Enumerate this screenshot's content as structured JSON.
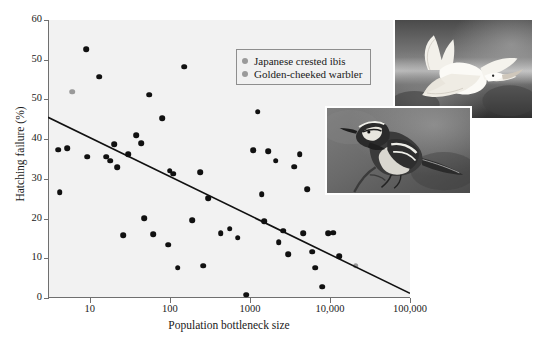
{
  "chart_data": {
    "type": "scatter",
    "title": "",
    "xlabel": "Population bottleneck size",
    "ylabel": "Hatching failure (%)",
    "xscale": "log",
    "xlim": [
      3,
      100000
    ],
    "ylim": [
      0,
      60
    ],
    "xticks": [
      10,
      100,
      1000,
      10000,
      100000
    ],
    "xtick_labels": [
      "10",
      "100",
      "1000",
      "10,000",
      "100,000"
    ],
    "yticks": [
      0,
      10,
      20,
      30,
      40,
      50,
      50,
      60
    ],
    "ytick_labels": [
      "0",
      "10",
      "20",
      "30",
      "40",
      "50",
      "50",
      "60"
    ],
    "grid": false,
    "legend_position": "upper-right-inside",
    "series": [
      {
        "name": "All species",
        "color": "#111111",
        "points": [
          [
            4.0,
            32.0
          ],
          [
            4.2,
            22.8
          ],
          [
            5.2,
            32.3
          ],
          [
            9.0,
            53.7
          ],
          [
            9.3,
            30.5
          ],
          [
            13.0,
            47.8
          ],
          [
            16.0,
            30.5
          ],
          [
            18.0,
            29.6
          ],
          [
            20.0,
            33.2
          ],
          [
            22.0,
            28.2
          ],
          [
            26.0,
            13.5
          ],
          [
            30.0,
            31.0
          ],
          [
            38.0,
            35.2
          ],
          [
            44.0,
            33.4
          ],
          [
            48.0,
            17.2
          ],
          [
            55.0,
            43.9
          ],
          [
            62.0,
            13.8
          ],
          [
            80.0,
            38.8
          ],
          [
            95.0,
            11.5
          ],
          [
            100.0,
            27.5
          ],
          [
            110.0,
            26.8
          ],
          [
            125.0,
            6.5
          ],
          [
            150.0,
            49.9
          ],
          [
            190.0,
            16.8
          ],
          [
            240.0,
            27.1
          ],
          [
            260.0,
            7.0
          ],
          [
            300.0,
            21.6
          ],
          [
            430.0,
            14.0
          ],
          [
            560.0,
            15.0
          ],
          [
            700.0,
            13.0
          ],
          [
            900.0,
            0.7
          ],
          [
            1100.0,
            31.9
          ],
          [
            1250.0,
            40.2
          ],
          [
            1400.0,
            22.4
          ],
          [
            1500.0,
            16.6
          ],
          [
            1700.0,
            31.7
          ],
          [
            2100.0,
            29.6
          ],
          [
            2300.0,
            12.0
          ],
          [
            2600.0,
            14.5
          ],
          [
            3000.0,
            9.4
          ],
          [
            3600.0,
            28.3
          ],
          [
            4200.0,
            31.0
          ],
          [
            4600.0,
            14.0
          ],
          [
            5200.0,
            23.5
          ],
          [
            6000.0,
            10.0
          ],
          [
            6500.0,
            6.5
          ],
          [
            8000.0,
            2.4
          ],
          [
            9500.0,
            14.0
          ],
          [
            11000.0,
            14.1
          ],
          [
            13000.0,
            9.0
          ]
        ]
      },
      {
        "name": "Japanese crested ibis",
        "color": "#9a9a9a",
        "points": [
          [
            6.0,
            44.5
          ]
        ]
      },
      {
        "name": "Golden-cheeked warbler",
        "color": "#9a9a9a",
        "points": [
          [
            21000.0,
            7.0
          ]
        ]
      }
    ],
    "trendline": {
      "type": "linear-on-log-x",
      "x_start": 3,
      "y_start": 39.0,
      "x_end": 100000,
      "y_end": 1.0,
      "color": "#111111"
    },
    "legend": [
      {
        "label": "Japanese crested ibis",
        "color": "#9a9a9a"
      },
      {
        "label": "Golden-cheeked warbler",
        "color": "#9a9a9a"
      }
    ],
    "photos": [
      {
        "name": "japanese-crested-ibis-photo",
        "caption": "Japanese crested ibis in flight"
      },
      {
        "name": "golden-cheeked-warbler-photo",
        "caption": "Golden-cheeked warbler perched"
      }
    ]
  },
  "colors": {
    "plot_background": "#f2f2f2",
    "axis": "#6f6f6f",
    "point": "#111111",
    "highlight_point": "#9a9a9a",
    "legend_background": "#f1f1f1",
    "legend_border": "#8e8e8e"
  }
}
